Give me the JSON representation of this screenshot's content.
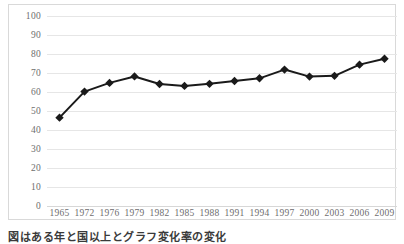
{
  "caption": "図はある年と国以上とグラフ変化率の変化",
  "colors": {
    "line": "#1a1a1a",
    "marker": "#1a1a1a",
    "gridline": "#e6e6e6",
    "border": "#d9d9d9",
    "tick_label": "#6e6e6e"
  },
  "chart_data": {
    "type": "line",
    "title": "",
    "subtitle": "",
    "xlabel": "",
    "ylabel": "",
    "categories": [
      "1965",
      "1972",
      "1976",
      "1979",
      "1982",
      "1985",
      "1988",
      "1991",
      "1994",
      "1997",
      "2000",
      "2003",
      "2006",
      "2009"
    ],
    "values": [
      46.5,
      60.2,
      64.8,
      68.2,
      64.2,
      63.2,
      64.3,
      65.8,
      67.2,
      71.8,
      68.1,
      68.5,
      74.4,
      77.5
    ],
    "series": [
      {
        "name": "series-1",
        "values": [
          46.5,
          60.2,
          64.8,
          68.2,
          64.2,
          63.2,
          64.3,
          65.8,
          67.2,
          71.8,
          68.1,
          68.5,
          74.4,
          77.5
        ]
      }
    ],
    "ylim": [
      0,
      100
    ],
    "ytick_step": 10,
    "yticks": [
      100,
      90,
      80,
      70,
      60,
      50,
      40,
      30,
      20,
      10,
      0
    ],
    "grid": "horizontal",
    "legend": "none",
    "marker": "diamond"
  }
}
